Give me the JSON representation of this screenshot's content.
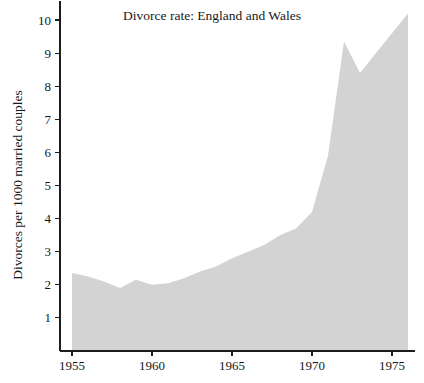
{
  "chart_data": {
    "type": "area",
    "title": "Divorce rate:  England and Wales",
    "xlabel": "",
    "ylabel": "Divorces per 1000 married couples",
    "grid": false,
    "legend": "none",
    "xlim": [
      1953.0,
      1977.5
    ],
    "ylim": [
      0,
      10.5
    ],
    "x_tick_labels": [
      "1955",
      "1960",
      "1965",
      "1970",
      "1975"
    ],
    "x_ticks": [
      1955,
      1960,
      1965,
      1970,
      1975
    ],
    "y_tick_labels": [
      "1",
      "2",
      "3",
      "4",
      "5",
      "6",
      "7",
      "8",
      "9",
      "10"
    ],
    "y_ticks": [
      1,
      2,
      3,
      4,
      5,
      6,
      7,
      8,
      9,
      10
    ],
    "fill_color": "#d3d3d3",
    "axis_color": "#1b1d1f",
    "background_color": "#ffffff",
    "x": [
      1955,
      1956,
      1957,
      1958,
      1959,
      1960,
      1961,
      1962,
      1963,
      1964,
      1965,
      1966,
      1967,
      1968,
      1969,
      1970,
      1971,
      1972,
      1973,
      1974,
      1975,
      1976
    ],
    "values": [
      2.36,
      2.25,
      2.1,
      1.9,
      2.15,
      2.0,
      2.05,
      2.2,
      2.4,
      2.55,
      2.8,
      3.0,
      3.2,
      3.5,
      3.7,
      4.2,
      5.9,
      9.35,
      8.4,
      9.0,
      9.6,
      10.2
    ],
    "series": [
      {
        "name": "Divorce rate",
        "values": [
          2.36,
          2.25,
          2.1,
          1.9,
          2.15,
          2.0,
          2.05,
          2.2,
          2.4,
          2.55,
          2.8,
          3.0,
          3.2,
          3.5,
          3.7,
          4.2,
          5.9,
          9.35,
          8.4,
          9.0,
          9.6,
          10.2
        ]
      }
    ]
  }
}
